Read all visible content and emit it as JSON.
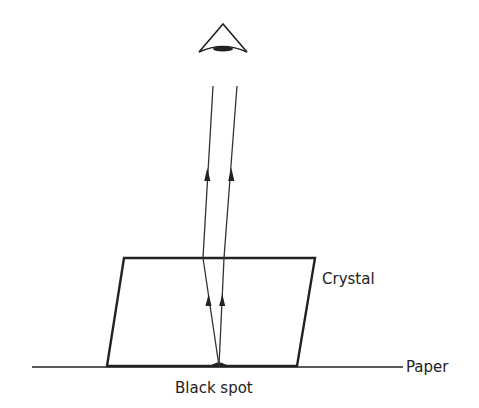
{
  "diagram": {
    "type": "optics-refraction",
    "labels": {
      "crystal": "Crystal",
      "paper": "Paper",
      "black_spot": "Black spot"
    },
    "elements": {
      "eye": {
        "icon": "eye-icon",
        "position": [
          223,
          48
        ]
      },
      "crystal": {
        "shape": "parallelogram",
        "top_left": [
          124,
          258
        ],
        "top_right": [
          315,
          258
        ],
        "bottom_right": [
          297,
          366
        ],
        "bottom_left": [
          107,
          366
        ]
      },
      "paper_line": {
        "from": [
          32,
          367
        ],
        "to": [
          403,
          367
        ]
      },
      "black_spot": {
        "position": [
          219,
          366
        ]
      },
      "rays": [
        {
          "name": "left-ray",
          "points": [
            [
              219,
              366
            ],
            [
              203,
              258
            ],
            [
              213,
              86
            ]
          ]
        },
        {
          "name": "right-ray",
          "points": [
            [
              219,
              366
            ],
            [
              224,
              258
            ],
            [
              237,
              86
            ]
          ]
        }
      ]
    },
    "colors": {
      "ink": "#222222",
      "background": "#ffffff"
    }
  }
}
